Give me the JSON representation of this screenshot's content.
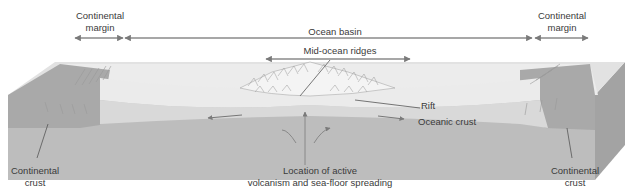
{
  "diagram": {
    "labels": {
      "continental_margin_left": [
        "Continental",
        "margin"
      ],
      "ocean_basin": "Ocean basin",
      "continental_margin_right": [
        "Continental",
        "margin"
      ],
      "mid_ocean_ridges": "Mid-ocean ridges",
      "rift": "Rift",
      "oceanic_crust": "Oceanic crust",
      "continental_crust_left": [
        "Continental",
        "crust"
      ],
      "continental_crust_right": [
        "Continental",
        "crust"
      ],
      "active_zone": [
        "Location of active",
        "volcanism and sea-floor spreading"
      ]
    },
    "colors": {
      "ocean_surface": "#ececec",
      "block_top_light": "#e6e6e6",
      "continent_side": "#a9a9a9",
      "mantle": "#b8b8b8",
      "oceanic_crust": "#d5d5d5",
      "arrow": "#808080",
      "text": "#3a3a3a"
    }
  }
}
